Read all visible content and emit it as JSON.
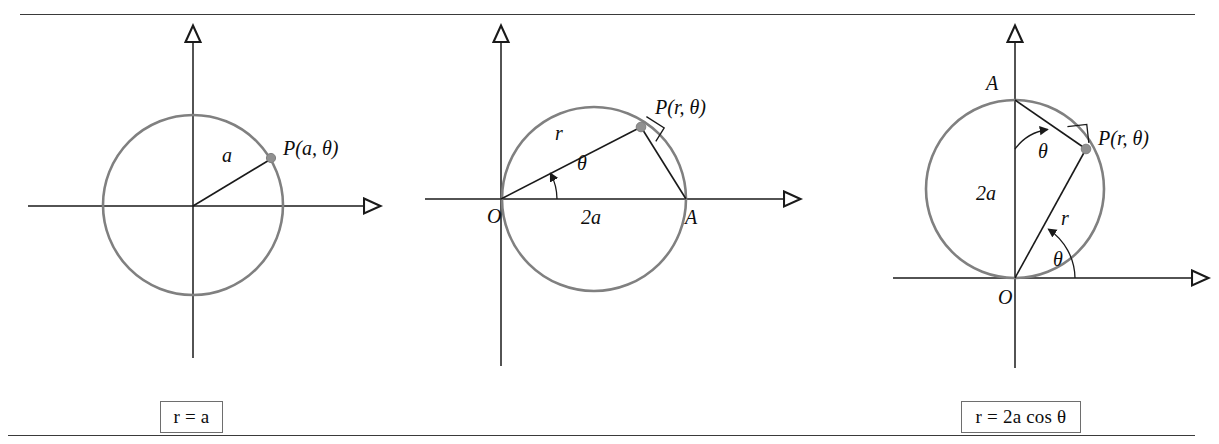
{
  "page": {
    "background_color": "#ffffff",
    "rule_color": "#3a3a3a",
    "circle_stroke_color": "#808080",
    "axis_color": "#1a1a1a",
    "point_marker_color": "#909090"
  },
  "panels": [
    {
      "id": "panel-1",
      "caption": "r = a",
      "caption_parts": {
        "lhs": "r",
        "eq": "=",
        "rhs": "a"
      },
      "geometry": {
        "circle_center": [
          193,
          187
        ],
        "circle_radius": 90,
        "x_axis": {
          "from": [
            28,
            188
          ],
          "to": [
            370,
            188
          ]
        },
        "y_axis": {
          "from": [
            193,
            340
          ],
          "to": [
            193,
            18
          ]
        },
        "point_P": [
          271,
          140
        ],
        "radius_line": {
          "from": [
            193,
            188
          ],
          "to": [
            271,
            140
          ]
        }
      },
      "labels": [
        {
          "name": "radius-label-a",
          "text": "a",
          "x": 222,
          "y": 144
        },
        {
          "name": "point-label-P",
          "text": "P(a, θ)",
          "x": 283,
          "y": 137
        }
      ]
    },
    {
      "id": "panel-2",
      "caption": "r = 2a cos θ",
      "caption_parts": {
        "lhs": "r",
        "eq": "=",
        "rhs": "2a cos θ"
      },
      "geometry": {
        "circle_center": [
          594,
          181
        ],
        "circle_radius": 92,
        "x_axis": {
          "from": [
            425,
            181
          ],
          "to": [
            790,
            181
          ]
        },
        "y_axis": {
          "from": [
            501,
            348
          ],
          "to": [
            501,
            18
          ]
        },
        "origin_O": [
          501,
          181
        ],
        "point_A": [
          686,
          181
        ],
        "point_P": [
          641,
          108
        ],
        "chord_OP": {
          "from": [
            501,
            181
          ],
          "to": [
            641,
            108
          ]
        },
        "chord_PA": {
          "from": [
            641,
            108
          ],
          "to": [
            686,
            181
          ]
        },
        "theta_arc_radius": 56,
        "theta_degrees": 27.5
      },
      "labels": [
        {
          "name": "radius-label-r",
          "text": "r",
          "x": 555,
          "y": 122
        },
        {
          "name": "angle-label-theta",
          "text": "θ",
          "x": 577,
          "y": 152
        },
        {
          "name": "origin-label-O",
          "text": "O",
          "x": 490,
          "y": 203
        },
        {
          "name": "diameter-label-2a",
          "text": "2a",
          "x": 583,
          "y": 205
        },
        {
          "name": "point-label-A",
          "text": "A",
          "x": 688,
          "y": 205
        },
        {
          "name": "point-label-P",
          "text": "P(r, θ)",
          "x": 657,
          "y": 96
        }
      ]
    },
    {
      "id": "panel-3",
      "caption": "r = 2a sin θ",
      "caption_parts": {
        "lhs": "r",
        "eq": "=",
        "rhs": "2a sin θ"
      },
      "geometry": {
        "circle_center": [
          1015,
          171
        ],
        "circle_radius": 89,
        "x_axis": {
          "from": [
            893,
            260
          ],
          "to": [
            1198,
            260
          ]
        },
        "y_axis": {
          "from": [
            1015,
            350
          ],
          "to": [
            1015,
            18
          ]
        },
        "origin_O": [
          1015,
          260
        ],
        "point_A": [
          1015,
          82
        ],
        "point_P": [
          1086,
          131
        ],
        "chord_AP": {
          "from": [
            1015,
            82
          ],
          "to": [
            1086,
            131
          ]
        },
        "chord_OP": {
          "from": [
            1015,
            260
          ],
          "to": [
            1086,
            131
          ]
        },
        "theta_degrees": 29
      },
      "labels": [
        {
          "name": "point-label-A",
          "text": "A",
          "x": 991,
          "y": 70
        },
        {
          "name": "angle-label-theta-top",
          "text": "θ",
          "x": 1042,
          "y": 135
        },
        {
          "name": "diameter-label-2a",
          "text": "2a",
          "x": 982,
          "y": 181
        },
        {
          "name": "radius-label-r",
          "text": "r",
          "x": 1065,
          "y": 204
        },
        {
          "name": "angle-label-theta-bottom",
          "text": "θ",
          "x": 1057,
          "y": 247
        },
        {
          "name": "origin-label-O",
          "text": "O",
          "x": 1001,
          "y": 285
        },
        {
          "name": "point-label-P",
          "text": "P(r, θ)",
          "x": 1100,
          "y": 126
        }
      ]
    }
  ]
}
